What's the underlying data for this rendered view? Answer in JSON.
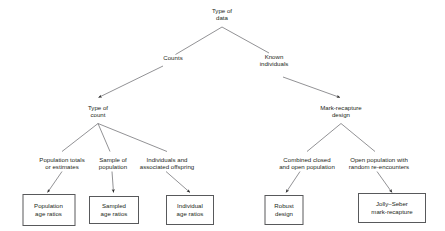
{
  "diagram": {
    "type": "hierarchical-tree",
    "colors": {
      "text": "#231f20",
      "line": "#58595b",
      "box_border": "#58595b",
      "background": "#ffffff"
    },
    "nodes": {
      "root": "Type of\ndata",
      "counts": "Counts",
      "known_individuals": "Known\nindividuals",
      "type_of_count": "Type of\ncount",
      "mark_recapture_design": "Mark-recapture\ndesign",
      "population_totals": "Population totals\nor estimates",
      "sample_of_population": "Sample of\npopulation",
      "individuals_offspring": "Individuals and\nassociated offspring",
      "combined_closed_open": "Combined closed\nand open population",
      "open_population_random": "Open population with\nrandom re-encounters"
    },
    "terminals": {
      "population_age_ratios": "Population\nage ratios",
      "sampled_age_ratios": "Sampled\nage ratios",
      "individual_age_ratios": "Individual\nage ratios",
      "robust_design": "Robust\ndesign",
      "jolly_seber": "Jolly–Seber\nmark-recapture"
    }
  }
}
